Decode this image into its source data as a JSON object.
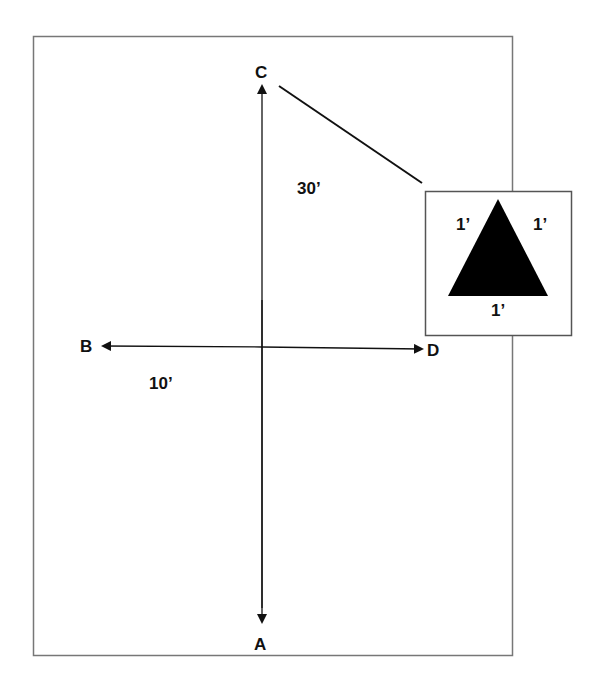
{
  "diagram": {
    "points": {
      "A": "A",
      "B": "B",
      "C": "C",
      "D": "D"
    },
    "dimensions": {
      "vertical": "30’",
      "horizontal": "10’"
    },
    "inset": {
      "shape": "equilateral-triangle",
      "side_left": "1’",
      "side_right": "1’",
      "side_bottom": "1’"
    },
    "colors": {
      "line": "#111111",
      "frame": "#777777",
      "fill": "#000000"
    }
  }
}
